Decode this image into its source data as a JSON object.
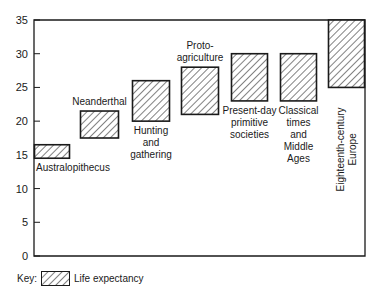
{
  "chart_data": {
    "type": "bar",
    "subtype": "floating-range",
    "title": "",
    "xlabel": "",
    "ylabel": "",
    "ylim": [
      0,
      35
    ],
    "yticks": [
      0,
      5,
      10,
      15,
      20,
      25,
      30,
      35
    ],
    "grid": false,
    "legend": {
      "position": "bottom-left",
      "prefix": "Key:",
      "entries": [
        "Life expectancy"
      ]
    },
    "series": [
      {
        "name": "Life expectancy",
        "fill": "hatched",
        "categories": [
          "Australopithecus",
          "Neanderthal",
          "Hunting and gathering",
          "Proto-agriculture",
          "Present-day primitive societies",
          "Classical times and Middle Ages",
          "Eighteenth-century Europe"
        ],
        "ranges": [
          [
            14.5,
            16.5
          ],
          [
            17.5,
            21.5
          ],
          [
            20,
            26
          ],
          [
            21,
            28
          ],
          [
            23,
            30
          ],
          [
            23,
            30
          ],
          [
            25,
            35
          ]
        ]
      }
    ]
  },
  "bars": [
    {
      "label_lines": [
        "Australopithecus"
      ],
      "label_pos": "below",
      "low": 14.5,
      "high": 16.5
    },
    {
      "label_lines": [
        "Neanderthal"
      ],
      "label_pos": "above",
      "low": 17.5,
      "high": 21.5
    },
    {
      "label_lines": [
        "Hunting",
        "and",
        "gathering"
      ],
      "label_pos": "below",
      "low": 20,
      "high": 26
    },
    {
      "label_lines": [
        "Proto-",
        "agriculture"
      ],
      "label_pos": "above",
      "low": 21,
      "high": 28
    },
    {
      "label_lines": [
        "Present-day",
        "primitive",
        "societies"
      ],
      "label_pos": "below",
      "low": 23,
      "high": 30
    },
    {
      "label_lines": [
        "Classical",
        "times",
        "and",
        "Middle",
        "Ages"
      ],
      "label_pos": "below",
      "low": 23,
      "high": 30
    },
    {
      "label_lines": [
        "Eighteenth-century",
        "Europe"
      ],
      "label_pos": "vertical",
      "low": 25,
      "high": 35
    }
  ],
  "key": {
    "prefix": "Key:",
    "label": "Life expectancy"
  },
  "colors": {
    "ink": "#1a1a1a",
    "background": "#ffffff"
  }
}
